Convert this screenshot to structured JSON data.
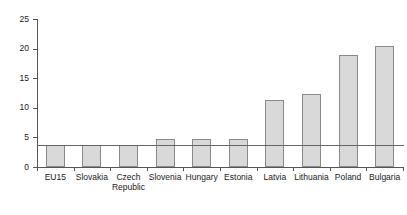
{
  "chart_data": {
    "type": "bar",
    "title": "",
    "subtitle": "",
    "xlabel": "",
    "ylabel": "",
    "ylim": [
      0,
      25
    ],
    "yticks": [
      0,
      5,
      10,
      15,
      20,
      25
    ],
    "ytick_labels": [
      "0",
      "5",
      "10",
      "15",
      "20",
      "25"
    ],
    "grid": false,
    "legend": null,
    "categories": [
      "EU15",
      "Slovakia",
      "Czech Republic",
      "Slovenia",
      "Hungary",
      "Estonia",
      "Latvia",
      "Lithuania",
      "Poland",
      "Bulgaria"
    ],
    "category_lines": [
      [
        "EU15"
      ],
      [
        "Slovakia"
      ],
      [
        "Czech",
        "Republic"
      ],
      [
        "Slovenia"
      ],
      [
        "Hungary"
      ],
      [
        "Estonia"
      ],
      [
        "Latvia"
      ],
      [
        "Lithuania"
      ],
      [
        "Poland"
      ],
      [
        "Bulgaria"
      ]
    ],
    "values": [
      3.8,
      3.7,
      3.7,
      4.8,
      4.7,
      4.8,
      11.4,
      12.3,
      19.0,
      20.4
    ],
    "annotations": [
      {
        "type": "reference-line",
        "orientation": "horizontal",
        "value": 3.7,
        "label": ""
      }
    ],
    "colors": {
      "bar_fill": "#d9d9d9",
      "bar_border": "#8a8a8a",
      "axis": "#555555",
      "reference_line": "#666666",
      "text": "#1a1a1a",
      "background": "#ffffff"
    }
  }
}
